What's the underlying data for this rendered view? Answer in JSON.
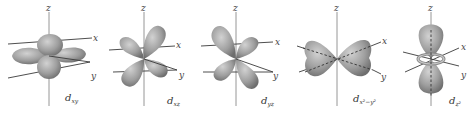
{
  "figure": {
    "axis_labels": {
      "z": "z",
      "x": "x",
      "y": "y"
    },
    "lobe_color": "#9c9c9c",
    "orbitals": [
      {
        "id": "dxy",
        "label_main": "d",
        "label_sub": "xy"
      },
      {
        "id": "dxz",
        "label_main": "d",
        "label_sub": "xz"
      },
      {
        "id": "dyz",
        "label_main": "d",
        "label_sub": "yz"
      },
      {
        "id": "dx2y2",
        "label_main": "d",
        "label_sub": "x²−y²"
      },
      {
        "id": "dz2",
        "label_main": "d",
        "label_sub": "z²"
      }
    ]
  }
}
